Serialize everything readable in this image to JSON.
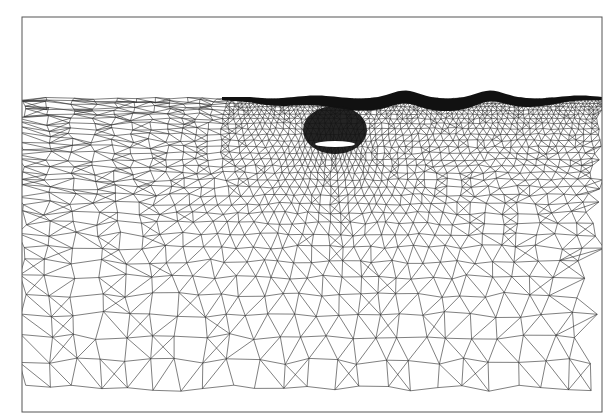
{
  "figure": {
    "description": "Unstructured triangular finite-element mesh around a submerged hydrofoil beneath a deforming free surface",
    "frame": {
      "x": 22,
      "y": 17,
      "width": 580,
      "height": 395
    },
    "air_region": {
      "top": 17,
      "bottom": 97
    },
    "free_surface": {
      "baseline_y": 97,
      "wave_crests": [
        {
          "x": 405,
          "y": 93
        },
        {
          "x": 490,
          "y": 93
        }
      ]
    },
    "hydrofoil": {
      "cx": 335,
      "cy": 144,
      "length": 40,
      "thickness": 6
    },
    "colors": {
      "background": "#ffffff",
      "mesh_line": "#2a2a2a",
      "dense_region": "#111111",
      "frame": "#555555"
    }
  }
}
